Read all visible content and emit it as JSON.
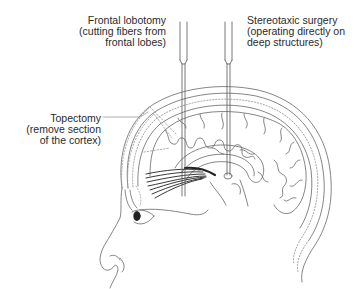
{
  "labels": {
    "frontal_lobotomy": {
      "lines": [
        "Frontal lobotomy",
        "(cutting fibers from",
        "frontal lobes)"
      ]
    },
    "stereotaxic_surgery": {
      "lines": [
        "Stereotaxic surgery",
        "(operating directly on",
        "deep structures)"
      ]
    },
    "topectomy": {
      "lines": [
        "Topectomy",
        "(remove section",
        "of the cortex)"
      ]
    }
  },
  "colors": {
    "line": "#555555",
    "text": "#2a2a2a",
    "fibers": "#222222",
    "background": "#ffffff"
  }
}
